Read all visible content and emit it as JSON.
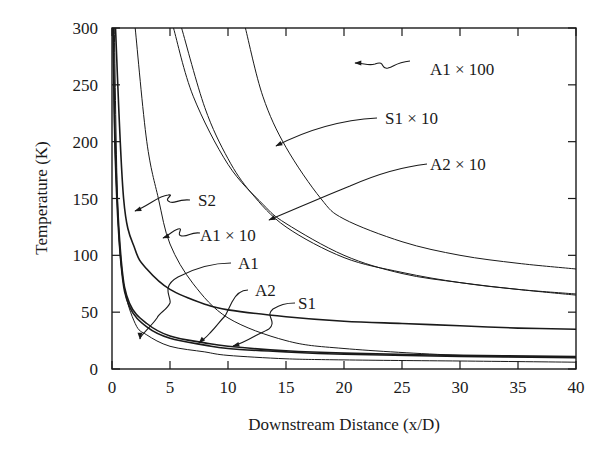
{
  "chart_data": {
    "type": "line",
    "title": "",
    "xlabel": "Downstream Distance (x/D)",
    "ylabel": "Temperature (K)",
    "xlim": [
      0,
      40
    ],
    "ylim": [
      0,
      300
    ],
    "xticks": [
      0,
      5,
      10,
      15,
      20,
      25,
      30,
      35,
      40
    ],
    "yticks": [
      0,
      50,
      100,
      150,
      200,
      250,
      300
    ],
    "grid": false,
    "legend": "none (curves labelled with arrow annotations)",
    "series": [
      {
        "name": "S2",
        "x": [
          0.3,
          1,
          2,
          3,
          5,
          8,
          10,
          15,
          20,
          25,
          30,
          35,
          40
        ],
        "y": [
          300,
          150,
          105,
          88,
          70,
          57,
          52,
          46,
          42,
          40,
          38,
          36,
          35
        ]
      },
      {
        "name": "A1",
        "x": [
          0.2,
          0.5,
          1,
          2,
          3,
          5,
          8,
          10,
          15,
          20,
          30,
          40
        ],
        "y": [
          300,
          140,
          75,
          40,
          30,
          20,
          15,
          12,
          9,
          8,
          7,
          6
        ]
      },
      {
        "name": "A2",
        "x": [
          0.1,
          0.3,
          0.8,
          1.5,
          3,
          5,
          8,
          10,
          15,
          20,
          30,
          40
        ],
        "y": [
          300,
          180,
          90,
          55,
          37,
          27,
          21,
          18,
          15,
          13,
          11,
          10
        ]
      },
      {
        "name": "S1",
        "x": [
          0.1,
          0.3,
          0.8,
          1.5,
          3,
          5,
          8,
          10,
          15,
          20,
          30,
          40
        ],
        "y": [
          300,
          190,
          95,
          58,
          40,
          29,
          23,
          20,
          16,
          14,
          12,
          11
        ]
      },
      {
        "name": "A1 × 10",
        "x": [
          2,
          3,
          4,
          5,
          7,
          10,
          15,
          20,
          30,
          40
        ],
        "y": [
          300,
          200,
          150,
          110,
          75,
          45,
          25,
          18,
          12,
          10
        ]
      },
      {
        "name": "S1 × 10",
        "x": [
          5.3,
          7,
          10,
          13,
          15,
          20,
          25,
          30,
          35,
          40
        ],
        "y": [
          300,
          240,
          180,
          145,
          128,
          100,
          84,
          76,
          70,
          65
        ]
      },
      {
        "name": "A2 × 10",
        "x": [
          6,
          8,
          10,
          12,
          15,
          20,
          25,
          30,
          35,
          40
        ],
        "y": [
          300,
          230,
          185,
          155,
          125,
          98,
          85,
          76,
          70,
          66
        ]
      },
      {
        "name": "A1 × 100",
        "x": [
          11.5,
          13,
          15,
          18,
          20,
          25,
          30,
          35,
          40
        ],
        "y": [
          300,
          240,
          195,
          150,
          132,
          112,
          100,
          93,
          88
        ]
      }
    ],
    "annotations": [
      {
        "text": "A1 × 100",
        "points_to": "A1 × 100"
      },
      {
        "text": "S1 × 10",
        "points_to": "S1 × 10"
      },
      {
        "text": "A2 × 10",
        "points_to": "A2 × 10"
      },
      {
        "text": "S2",
        "points_to": "S2"
      },
      {
        "text": "A1 × 10",
        "points_to": "A1 × 10"
      },
      {
        "text": "A1",
        "points_to": "A1"
      },
      {
        "text": "A2",
        "points_to": "A2"
      },
      {
        "text": "S1",
        "points_to": "S1"
      }
    ]
  },
  "labels": {
    "xlabel": "Downstream Distance (x/D)",
    "ylabel": "Temperature (K)",
    "x_ticks": [
      "0",
      "5",
      "10",
      "15",
      "20",
      "25",
      "30",
      "35",
      "40"
    ],
    "y_ticks": [
      "0",
      "50",
      "100",
      "150",
      "200",
      "250",
      "300"
    ],
    "annot": {
      "a1x100": "A1 × 100",
      "s1x10": "S1 × 10",
      "a2x10": "A2 × 10",
      "s2": "S2",
      "a1x10": "A1 × 10",
      "a1": "A1",
      "a2": "A2",
      "s1": "S1"
    }
  }
}
